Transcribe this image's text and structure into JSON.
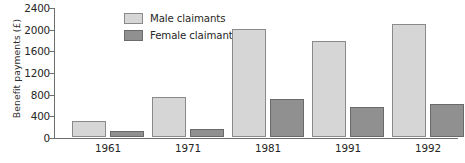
{
  "chart_data": {
    "type": "bar",
    "title": "",
    "xlabel": "",
    "ylabel": "Benefit payments (£)",
    "categories": [
      "1961",
      "1971",
      "1981",
      "1991",
      "1992"
    ],
    "series": [
      {
        "name": "Male claimants",
        "values": [
          300,
          730,
          2000,
          1770,
          2080
        ],
        "color": "#d6d6d6"
      },
      {
        "name": "Female claimants",
        "values": [
          120,
          145,
          700,
          545,
          610
        ],
        "color": "#909090"
      }
    ],
    "ylim": [
      0,
      2400
    ],
    "yticks": [
      0,
      400,
      800,
      1200,
      1600,
      2000,
      2400
    ],
    "ytick_labels": [
      "0",
      "400",
      "800",
      "1200",
      "1600",
      "2000",
      "2400"
    ],
    "grid": false,
    "legend_position": "upper left (inside plot area)"
  },
  "legend": {
    "items": [
      {
        "label": "Male claimants",
        "swatch": "#d6d6d6"
      },
      {
        "label": "Female claimants",
        "swatch": "#909090"
      }
    ]
  },
  "axes": {
    "y_title": "Benefit payments (£)",
    "y_ticks": [
      "2400",
      "2000",
      "1600",
      "1200",
      "800",
      "400",
      "0"
    ],
    "x_ticks": [
      "1961",
      "1971",
      "1981",
      "1991",
      "1992"
    ]
  },
  "caption_sliver": ""
}
